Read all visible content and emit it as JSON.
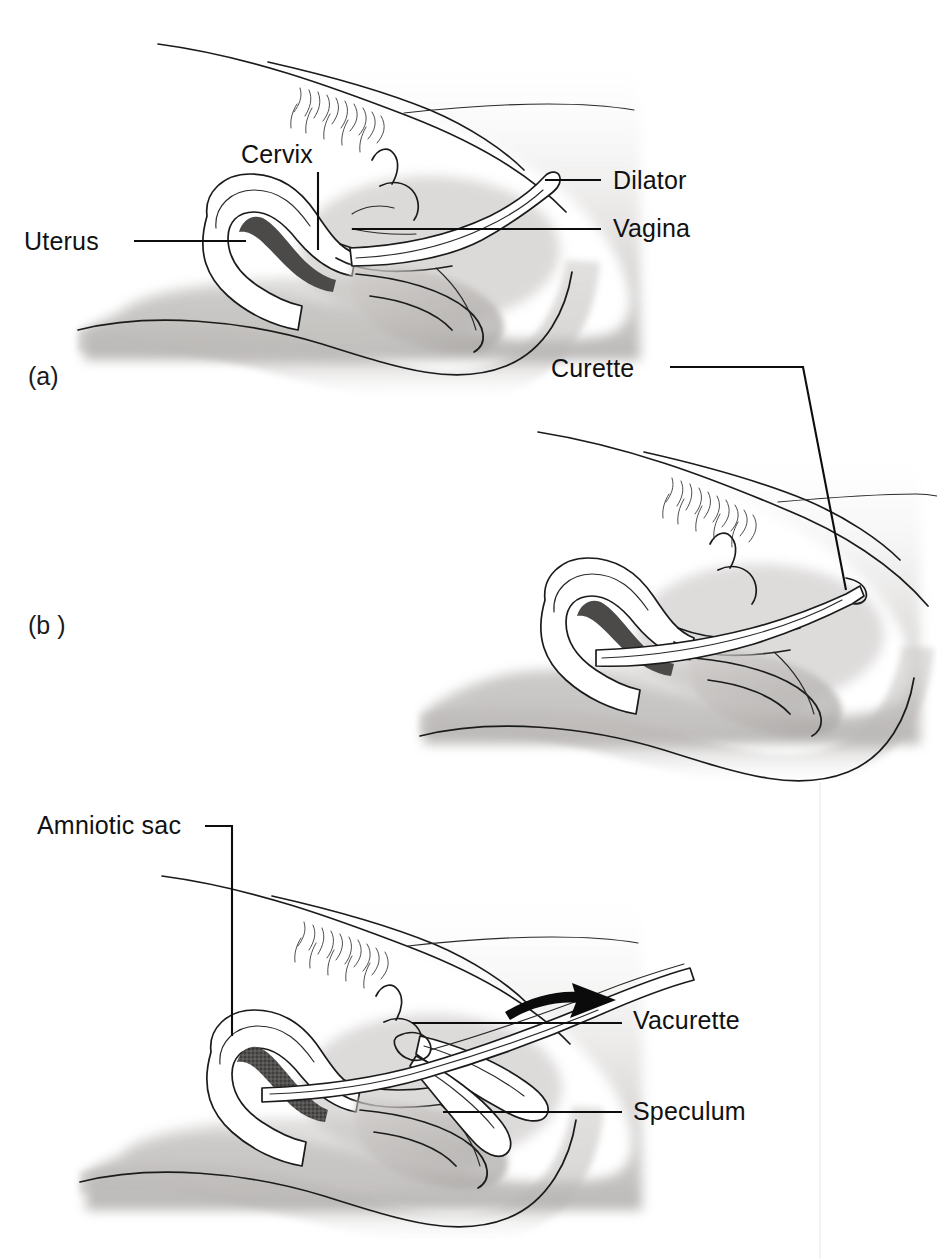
{
  "figure": {
    "background_color": "#ffffff",
    "ink_color": "#1b1b1b",
    "label_color": "#111111",
    "width": 937,
    "height": 1258
  },
  "panels": [
    {
      "id": "a",
      "letter": "(a)",
      "caption_x": 28,
      "caption_y": 385,
      "procedure": "Cervical dilatation with a dilator",
      "labels": [
        {
          "name": "cervix",
          "text": "Cervix",
          "text_x": 241,
          "text_y": 163,
          "anchor": "start",
          "leader": "M318,172 L318,250"
        },
        {
          "name": "uterus",
          "text": "Uterus",
          "text_x": 24,
          "text_y": 250,
          "anchor": "start",
          "leader": "M134,241 L246,241"
        },
        {
          "name": "dilator",
          "text": "Dilator",
          "text_x": 613,
          "text_y": 189,
          "anchor": "start",
          "leader": "M545,180 L601,180"
        },
        {
          "name": "vagina",
          "text": "Vagina",
          "text_x": 613,
          "text_y": 237,
          "anchor": "start",
          "leader": "M352,229 L601,229"
        }
      ]
    },
    {
      "id": "b",
      "letter": "(b )",
      "caption_x": 28,
      "caption_y": 634,
      "procedure": "Evacuation of uterine contents with a curette",
      "labels": [
        {
          "name": "curette",
          "text": "Curette",
          "text_x": 551,
          "text_y": 377,
          "anchor": "start",
          "leader": "M670,367 L803,367 L846,590"
        }
      ]
    },
    {
      "id": "c",
      "letter": "",
      "caption_x": 0,
      "caption_y": 0,
      "procedure": "Vacuum aspiration with a vacurette through a speculum",
      "labels": [
        {
          "name": "amniotic-sac",
          "text": "Amniotic sac",
          "text_x": 37,
          "text_y": 834,
          "anchor": "start",
          "leader": "M205,826 L232,826 L232,1036"
        },
        {
          "name": "vacurette",
          "text": "Vacurette",
          "text_x": 633,
          "text_y": 1029,
          "anchor": "start",
          "leader": "M412,1023 L622,1023"
        },
        {
          "name": "speculum",
          "text": "Speculum",
          "text_x": 633,
          "text_y": 1120,
          "anchor": "start",
          "leader": "M443,1112 L622,1112"
        }
      ]
    }
  ],
  "annotations": {
    "direction_arrow": {
      "name": "vacurette-direction-arrow",
      "description": "curved arrow pointing right above the vacurette"
    }
  }
}
